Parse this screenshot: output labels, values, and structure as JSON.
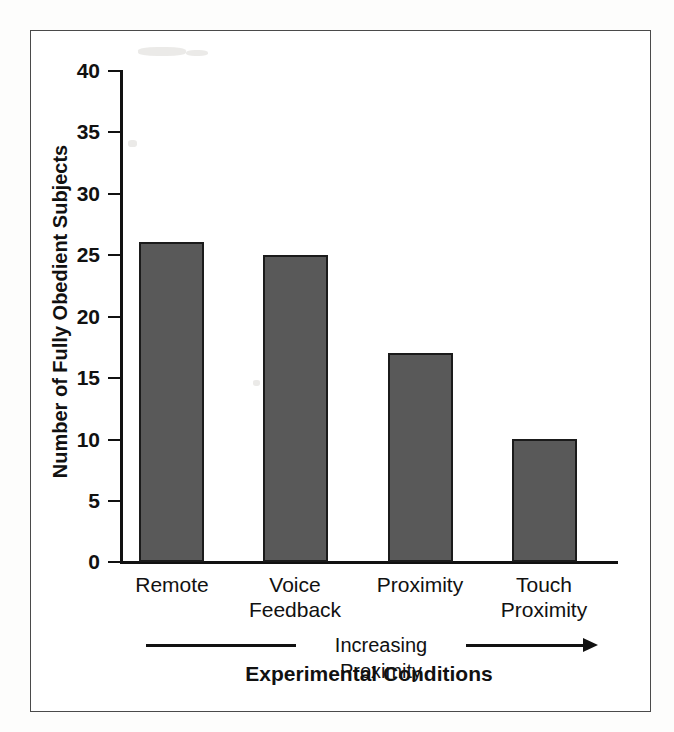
{
  "figure": {
    "background_color": "#ffffff",
    "frame_color": "#4a4a4a",
    "bar_fill_color": "#595959",
    "bar_edge_color": "#1b1b1b",
    "axis_color": "#111111"
  },
  "chart_data": {
    "type": "bar",
    "title": "",
    "xlabel": "Experimental Conditions",
    "ylabel": "Number of Fully Obedient Subjects",
    "categories": [
      "Remote",
      "Voice\nFeedback",
      "Proximity",
      "Touch\nProximity"
    ],
    "values": [
      26,
      25,
      17,
      10
    ],
    "ylim": [
      0,
      40
    ],
    "yticks": [
      0,
      5,
      10,
      15,
      20,
      25,
      30,
      35,
      40
    ],
    "ytick_labels": [
      "0",
      "5",
      "10",
      "15",
      "20",
      "25",
      "30",
      "35",
      "40"
    ],
    "grid": false,
    "legend": "none",
    "annotations": [
      {
        "name": "increasing-proximity-arrow",
        "text": "Increasing Proximity",
        "direction": "right"
      }
    ]
  }
}
